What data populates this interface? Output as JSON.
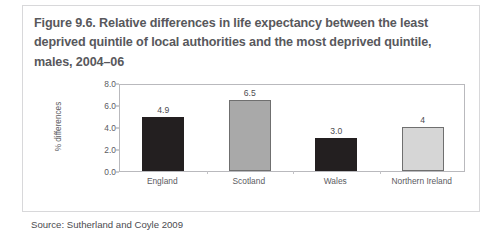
{
  "figure": {
    "title": "Figure 9.6. Relative differences in life expectancy between the least deprived quintile of local authorities and the most deprived quintile, males, 2004–06",
    "source": "Source: Sutherland and Coyle 2009"
  },
  "chart_data": {
    "type": "bar",
    "title": "Figure 9.6. Relative differences in life expectancy between the least deprived quintile of local authorities and the most deprived quintile, males, 2004–06",
    "categories": [
      "England",
      "Scotland",
      "Wales",
      "Northern Ireland"
    ],
    "values": [
      4.9,
      6.5,
      3.0,
      4.0
    ],
    "value_labels": [
      "4.9",
      "6.5",
      "3.0",
      "4"
    ],
    "bar_colors": [
      "#231f20",
      "#a9a9a9",
      "#231f20",
      "#d6d6d6"
    ],
    "bar_border_colors": [
      "#231f20",
      "#6f6f6f",
      "#231f20",
      "#6f6f6f"
    ],
    "xlabel": "",
    "ylabel": "% differences",
    "ylim": [
      0.0,
      8.0
    ],
    "ytick_labels": [
      "0.0",
      "2.0",
      "4.0",
      "6.0",
      "8.0"
    ],
    "ytick_values": [
      0.0,
      2.0,
      4.0,
      6.0,
      8.0
    ],
    "grid": false,
    "legend": false
  },
  "colors": {
    "card_border": "#d8d8da",
    "title_text": "#58585c",
    "axis_text": "#5b5b5f",
    "plot_frame": "#b9b9bd",
    "page_background": "#ffffff"
  }
}
